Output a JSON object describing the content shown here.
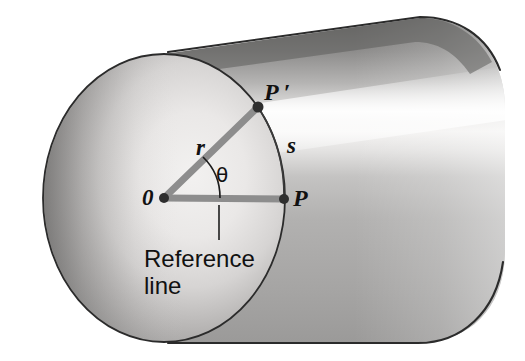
{
  "figure": {
    "kind": "physics-diagram",
    "background_color": "#ffffff"
  },
  "labels": {
    "origin": "0",
    "radius": "r",
    "theta": "θ",
    "point_p_prime": "P ′",
    "arc_length": "s",
    "point_p": "P",
    "reference_line_1": "Reference",
    "reference_line_2": "line"
  },
  "geometry": {
    "circle_face": {
      "center_x": 164,
      "center_y": 198,
      "radius_x": 121,
      "radius_y": 144
    },
    "origin_point": {
      "x": 164,
      "y": 198
    },
    "point_p": {
      "x": 284,
      "y": 199
    },
    "point_p_prime": {
      "x": 258,
      "y": 107
    },
    "theta_arc_radius": 56,
    "theta_degrees": 37
  },
  "colors": {
    "outline": "#2b2b2b",
    "spoke": "#8d8d8d",
    "spoke_dark": "#7a7a7a",
    "marker_dot": "#2e2e2e",
    "face_light": "#eceaea",
    "face_mid": "#c9c7c7",
    "face_dark": "#8b8a8a",
    "body_light": "#e8e7e6",
    "body_mid": "#b8b7b6",
    "body_dark": "#8e8d8c",
    "body_top_shadow": "#6f6e6d",
    "text": "#111111"
  }
}
